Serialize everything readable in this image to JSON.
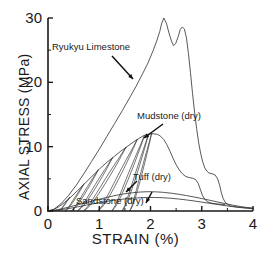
{
  "figure": {
    "background_color": "#ffffff",
    "line_color": "#3a3a3a",
    "axis_color": "#1a1a1a"
  },
  "axes": {
    "x_title": "STRAIN (%)",
    "y_title": "AXIAL STRESS (MPa)",
    "x_ticks": [
      "0",
      "1",
      "2",
      "3",
      "4"
    ],
    "y_ticks": [
      "0",
      "10",
      "20",
      "30"
    ]
  },
  "annotations": [
    {
      "name": "ryukyu-limestone",
      "label": "Ryukyu Limestone",
      "x": 52,
      "y": 41
    },
    {
      "name": "mudstone-dry",
      "label": "Mudstone (dry)",
      "x": 137,
      "y": 110
    },
    {
      "name": "tuff-dry",
      "label": "Tuff (dry)",
      "x": 133,
      "y": 171
    },
    {
      "name": "sandstone-dry",
      "label": "Sandstone (dry)",
      "x": 76,
      "y": 195
    }
  ],
  "chart_data": {
    "type": "line",
    "title": "",
    "xlabel": "STRAIN (%)",
    "ylabel": "AXIAL STRESS (MPa)",
    "xlim": [
      0,
      4
    ],
    "ylim": [
      0,
      30
    ],
    "x_major_ticks": [
      0,
      1,
      2,
      3,
      4
    ],
    "y_major_ticks": [
      0,
      10,
      20,
      30
    ],
    "x_minor_ticks": [
      0.5,
      1.5,
      2.5,
      3.5
    ],
    "y_minor_ticks": [
      5,
      15,
      25
    ],
    "grid": false,
    "legend": "inline-annotations-with-arrows",
    "series": [
      {
        "name": "Ryukyu Limestone",
        "peak_stress": 30.0,
        "peak_strain": 2.25,
        "points": [
          [
            0.0,
            0.0
          ],
          [
            0.12,
            0.3
          ],
          [
            0.25,
            1.1
          ],
          [
            0.4,
            2.4
          ],
          [
            0.55,
            4.0
          ],
          [
            0.7,
            5.8
          ],
          [
            0.85,
            7.7
          ],
          [
            1.0,
            9.6
          ],
          [
            1.15,
            11.6
          ],
          [
            1.3,
            13.6
          ],
          [
            1.45,
            15.6
          ],
          [
            1.6,
            17.7
          ],
          [
            1.72,
            19.4
          ],
          [
            1.85,
            21.4
          ],
          [
            1.95,
            23.0
          ],
          [
            2.05,
            24.9
          ],
          [
            2.12,
            26.4
          ],
          [
            2.18,
            27.9
          ],
          [
            2.22,
            29.2
          ],
          [
            2.26,
            30.0
          ],
          [
            2.31,
            29.2
          ],
          [
            2.36,
            27.7
          ],
          [
            2.41,
            26.4
          ],
          [
            2.45,
            25.7
          ],
          [
            2.49,
            26.0
          ],
          [
            2.54,
            27.1
          ],
          [
            2.58,
            28.2
          ],
          [
            2.62,
            28.6
          ],
          [
            2.66,
            28.3
          ],
          [
            2.7,
            27.0
          ],
          [
            2.74,
            24.5
          ],
          [
            2.78,
            21.5
          ],
          [
            2.82,
            18.3
          ],
          [
            2.86,
            15.4
          ],
          [
            2.9,
            12.8
          ],
          [
            2.94,
            10.6
          ],
          [
            2.98,
            8.9
          ],
          [
            3.02,
            7.6
          ],
          [
            3.06,
            6.7
          ],
          [
            3.1,
            6.2
          ],
          [
            3.14,
            5.9
          ],
          [
            3.2,
            5.8
          ],
          [
            3.26,
            5.6
          ],
          [
            3.31,
            5.0
          ],
          [
            3.35,
            4.0
          ],
          [
            3.38,
            2.9
          ],
          [
            3.42,
            1.9
          ],
          [
            3.47,
            1.2
          ],
          [
            3.55,
            0.8
          ],
          [
            3.7,
            0.6
          ],
          [
            3.85,
            0.5
          ],
          [
            4.0,
            0.45
          ]
        ]
      },
      {
        "name": "Mudstone (dry)",
        "peak_stress": 12.0,
        "peak_strain": 2.05,
        "description": "cyclic loading with dense hysteresis loops up to peak, then post-peak softening with shoulder",
        "envelope_points": [
          [
            0.0,
            0.0
          ],
          [
            0.1,
            0.2
          ],
          [
            0.2,
            0.6
          ],
          [
            0.32,
            1.3
          ],
          [
            0.45,
            2.2
          ],
          [
            0.58,
            3.2
          ],
          [
            0.72,
            4.3
          ],
          [
            0.86,
            5.4
          ],
          [
            1.0,
            6.5
          ],
          [
            1.14,
            7.5
          ],
          [
            1.28,
            8.4
          ],
          [
            1.42,
            9.3
          ],
          [
            1.56,
            10.1
          ],
          [
            1.68,
            10.8
          ],
          [
            1.78,
            11.3
          ],
          [
            1.86,
            11.7
          ],
          [
            1.93,
            11.9
          ],
          [
            2.0,
            12.0
          ],
          [
            2.07,
            12.0
          ],
          [
            2.14,
            11.9
          ],
          [
            2.2,
            11.6
          ],
          [
            2.26,
            11.1
          ],
          [
            2.32,
            10.3
          ],
          [
            2.38,
            9.3
          ],
          [
            2.44,
            8.2
          ],
          [
            2.5,
            7.2
          ],
          [
            2.56,
            6.4
          ],
          [
            2.62,
            5.8
          ],
          [
            2.68,
            5.4
          ],
          [
            2.75,
            5.2
          ],
          [
            2.82,
            5.1
          ],
          [
            2.88,
            4.9
          ],
          [
            2.93,
            4.3
          ],
          [
            2.97,
            3.4
          ],
          [
            3.01,
            2.5
          ],
          [
            3.06,
            1.8
          ],
          [
            3.12,
            1.4
          ],
          [
            3.2,
            1.2
          ],
          [
            3.3,
            1.1
          ],
          [
            3.45,
            1.0
          ]
        ],
        "hysteresis_loops": [
          {
            "unload_from_strain": 0.42,
            "unload_from_stress": 2.1,
            "return_to_strain": 0.22
          },
          {
            "unload_from_strain": 0.7,
            "unload_from_stress": 4.2,
            "return_to_strain": 0.34
          },
          {
            "unload_from_strain": 0.98,
            "unload_from_stress": 6.4,
            "return_to_strain": 0.46
          },
          {
            "unload_from_strain": 1.26,
            "unload_from_stress": 8.3,
            "return_to_strain": 0.58
          },
          {
            "unload_from_strain": 1.52,
            "unload_from_stress": 9.9,
            "return_to_strain": 0.7
          },
          {
            "unload_from_strain": 1.74,
            "unload_from_stress": 11.1,
            "return_to_strain": 0.98
          },
          {
            "unload_from_strain": 1.88,
            "unload_from_stress": 11.7,
            "return_to_strain": 1.25
          },
          {
            "unload_from_strain": 1.96,
            "unload_from_stress": 11.9,
            "return_to_strain": 1.45
          },
          {
            "unload_from_strain": 2.02,
            "unload_from_stress": 12.0,
            "return_to_strain": 1.6
          }
        ]
      },
      {
        "name": "Tuff (dry)",
        "peak_stress": 3.0,
        "peak_strain": 1.95,
        "points": [
          [
            0.0,
            0.0
          ],
          [
            0.15,
            0.15
          ],
          [
            0.3,
            0.4
          ],
          [
            0.45,
            0.7
          ],
          [
            0.6,
            1.0
          ],
          [
            0.75,
            1.32
          ],
          [
            0.9,
            1.63
          ],
          [
            1.05,
            1.93
          ],
          [
            1.2,
            2.22
          ],
          [
            1.35,
            2.47
          ],
          [
            1.5,
            2.68
          ],
          [
            1.65,
            2.84
          ],
          [
            1.8,
            2.95
          ],
          [
            1.95,
            3.0
          ],
          [
            2.1,
            2.98
          ],
          [
            2.25,
            2.9
          ],
          [
            2.4,
            2.77
          ],
          [
            2.55,
            2.6
          ],
          [
            2.7,
            2.4
          ],
          [
            2.85,
            2.18
          ],
          [
            3.0,
            1.94
          ],
          [
            3.15,
            1.68
          ],
          [
            3.3,
            1.42
          ],
          [
            3.45,
            1.16
          ],
          [
            3.6,
            0.92
          ],
          [
            3.75,
            0.7
          ],
          [
            3.9,
            0.52
          ],
          [
            4.0,
            0.42
          ]
        ]
      },
      {
        "name": "Sandstone (dry)",
        "peak_stress": 2.1,
        "peak_strain": 2.1,
        "points": [
          [
            0.0,
            0.0
          ],
          [
            0.15,
            0.1
          ],
          [
            0.3,
            0.25
          ],
          [
            0.45,
            0.45
          ],
          [
            0.6,
            0.68
          ],
          [
            0.75,
            0.92
          ],
          [
            0.9,
            1.15
          ],
          [
            1.05,
            1.37
          ],
          [
            1.2,
            1.57
          ],
          [
            1.35,
            1.74
          ],
          [
            1.5,
            1.88
          ],
          [
            1.65,
            1.99
          ],
          [
            1.8,
            2.06
          ],
          [
            1.95,
            2.1
          ],
          [
            2.1,
            2.1
          ],
          [
            2.25,
            2.06
          ],
          [
            2.4,
            1.98
          ],
          [
            2.55,
            1.86
          ],
          [
            2.7,
            1.72
          ],
          [
            2.85,
            1.56
          ],
          [
            3.0,
            1.38
          ],
          [
            3.15,
            1.2
          ],
          [
            3.3,
            1.02
          ],
          [
            3.45,
            0.84
          ],
          [
            3.6,
            0.68
          ],
          [
            3.75,
            0.54
          ],
          [
            3.9,
            0.42
          ],
          [
            4.0,
            0.35
          ]
        ]
      }
    ]
  }
}
